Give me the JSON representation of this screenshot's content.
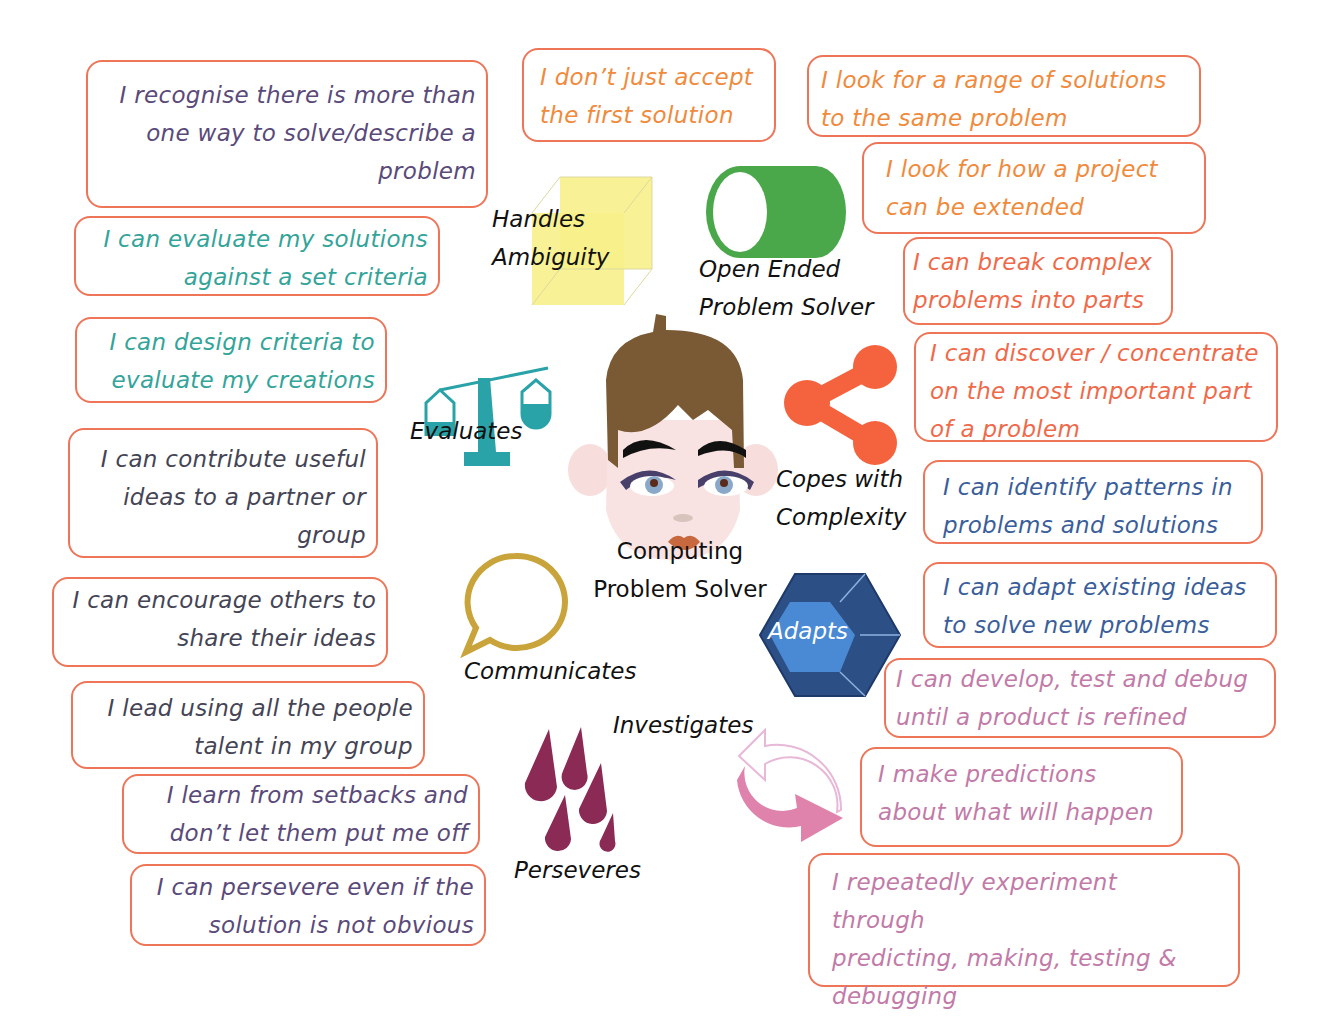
{
  "center": {
    "label": "Computing\nProblem Solver"
  },
  "traits": [
    {
      "id": "handles-ambiguity",
      "label": "Handles\nAmbiguity",
      "icon": "cube-icon",
      "color": "#f7f08a"
    },
    {
      "id": "open-ended",
      "label": "Open Ended\nProblem Solver",
      "icon": "cylinder-icon",
      "color": "#4aa84a"
    },
    {
      "id": "evaluates",
      "label": "Evaluates",
      "icon": "scales-icon",
      "color": "#2aa3a8"
    },
    {
      "id": "copes-complexity",
      "label": "Copes with\nComplexity",
      "icon": "share-network-icon",
      "color": "#f4623e"
    },
    {
      "id": "communicates",
      "label": "Communicates",
      "icon": "speech-bubble-icon",
      "color": "#c9a43a"
    },
    {
      "id": "adapts",
      "label": "Adapts",
      "icon": "hexagon-gem-icon",
      "color": "#2c4f86"
    },
    {
      "id": "investigates",
      "label": "Investigates",
      "icon": "cycle-arrows-icon",
      "color": "#df82ac"
    },
    {
      "id": "perseveres",
      "label": "Perseveres",
      "icon": "raindrops-icon",
      "color": "#8a2a55"
    }
  ],
  "statements": {
    "recognise": "I recognise there is more than\none way to solve/describe a\nproblem",
    "evaluate_solutions": "I can evaluate my solutions\nagainst a set criteria",
    "design_criteria": "I can design criteria to\nevaluate my creations",
    "contribute": "I can contribute useful\nideas to a partner or\ngroup",
    "encourage": "I can encourage others to\nshare their ideas",
    "lead": "I lead using all the people\ntalent in my group",
    "learn_setbacks": "I learn from setbacks and\ndon’t let them put me off",
    "persevere": "I can persevere even if the\nsolution is not obvious",
    "dont_accept": "I don’t just accept\nthe first solution",
    "range_solutions": "I look for a range of solutions\nto the same problem",
    "project_extended": "I look for how a project\ncan be extended",
    "break_complex": "I can break complex\nproblems into parts",
    "discover_concentrate": "I can discover / concentrate\non the most important part\nof a problem",
    "identify_patterns": "I can identify patterns in\nproblems and solutions",
    "adapt_ideas": "I can adapt existing ideas\nto solve new problems",
    "develop_test": "I can develop, test and debug\nuntil a product is refined",
    "predictions": "I make predictions\nabout what will happen",
    "experiment": "I repeatedly experiment through\npredicting, making, testing &\ndebugging"
  },
  "colors": {
    "border": "#ee7558",
    "text_purple": "#5a4a7a",
    "text_teal": "#33a49a",
    "text_dark": "#444455",
    "text_orange": "#f08a3c",
    "text_red": "#ef6a4a",
    "text_blue": "#3a5e9a",
    "text_pink": "#c27aa8"
  }
}
